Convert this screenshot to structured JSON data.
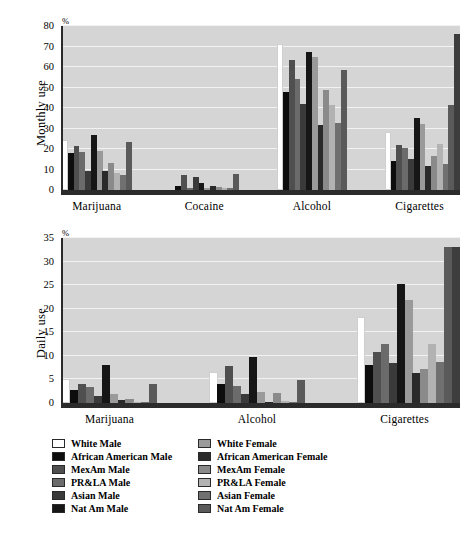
{
  "figure": {
    "background": "#ffffff",
    "plot_background": "#d5d5d5",
    "gridline_color": "#f2f2f2",
    "baseline_color": "#4a4a4a"
  },
  "series_names": [
    "White Male",
    "African American Male",
    "MexAm Male",
    "PR&LA Male",
    "Asian Male",
    "Nat Am Male",
    "White Female",
    "African American Female",
    "MexAm Female",
    "PR&LA Female",
    "Asian Female",
    "Nat Am Female"
  ],
  "series_colors": [
    "#ffffff",
    "#0d0d0d",
    "#4f4f4f",
    "#6b6b6b",
    "#3a3a3a",
    "#161616",
    "#9a9a9a",
    "#2a2a2a",
    "#8a8a8a",
    "#b2b2b2",
    "#707070",
    "#5a5a5a"
  ],
  "legend": {
    "columns": [
      [
        {
          "label": "White Male",
          "color": "#ffffff"
        },
        {
          "label": "African American Male",
          "color": "#0d0d0d"
        },
        {
          "label": "MexAm Male",
          "color": "#4f4f4f"
        },
        {
          "label": "PR&LA Male",
          "color": "#6b6b6b"
        },
        {
          "label": "Asian Male",
          "color": "#3a3a3a"
        },
        {
          "label": "Nat Am Male",
          "color": "#161616"
        }
      ],
      [
        {
          "label": "White Female",
          "color": "#9a9a9a"
        },
        {
          "label": "African American Female",
          "color": "#2a2a2a"
        },
        {
          "label": "MexAm Female",
          "color": "#8a8a8a"
        },
        {
          "label": "PR&LA Female",
          "color": "#b2b2b2"
        },
        {
          "label": "Asian Female",
          "color": "#707070"
        },
        {
          "label": "Nat Am Female",
          "color": "#5a5a5a"
        }
      ]
    ]
  },
  "chart_data": [
    {
      "type": "bar",
      "title": "",
      "ylabel": "Monthly use",
      "xlabel": "",
      "unit_label": "%",
      "ylim": [
        0,
        80
      ],
      "yticks": [
        0,
        10,
        20,
        30,
        40,
        50,
        60,
        70,
        80
      ],
      "grid": true,
      "legend_position": "below-figure",
      "categories": [
        "Marijuana",
        "Cocaine",
        "Alcohol",
        "Cigarettes"
      ],
      "series": [
        {
          "name": "White Male",
          "values": [
            24.5,
            0,
            71.0,
            28.5
          ]
        },
        {
          "name": "African American Male",
          "values": [
            18.0,
            2.0,
            48.0,
            14.0
          ]
        },
        {
          "name": "MexAm Male",
          "values": [
            21.5,
            7.5,
            63.5,
            22.0
          ]
        },
        {
          "name": "PR&LA Male",
          "values": [
            18.5,
            1.0,
            54.0,
            20.5
          ]
        },
        {
          "name": "Asian Male",
          "values": [
            9.5,
            6.5,
            42.0,
            15.0
          ]
        },
        {
          "name": "Nat Am Male",
          "values": [
            27.0,
            3.5,
            67.5,
            35.0
          ]
        },
        {
          "name": "White Female",
          "values": [
            19.0,
            0.8,
            65.0,
            32.0
          ]
        },
        {
          "name": "African American Female",
          "values": [
            9.5,
            2.0,
            31.5,
            11.5
          ]
        },
        {
          "name": "MexAm Female",
          "values": [
            13.0,
            1.5,
            49.0,
            16.5
          ]
        },
        {
          "name": "PR&LA Female",
          "values": [
            8.5,
            1.2,
            41.5,
            22.5
          ]
        },
        {
          "name": "Asian Female",
          "values": [
            7.5,
            1.0,
            32.5,
            12.5
          ]
        },
        {
          "name": "Nat Am Female",
          "values": [
            23.5,
            8.0,
            58.5,
            41.5
          ]
        }
      ],
      "overflow_bar": {
        "category": "Cigarettes",
        "series": "Nat Am Female",
        "value": 76.0
      }
    },
    {
      "type": "bar",
      "title": "",
      "ylabel": "Daily use",
      "xlabel": "",
      "unit_label": "%",
      "ylim": [
        0,
        35
      ],
      "yticks": [
        0,
        5,
        10,
        15,
        20,
        25,
        30,
        35
      ],
      "grid": true,
      "legend_position": "below-figure",
      "categories": [
        "Marijuana",
        "Alcohol",
        "Cigarettes"
      ],
      "series": [
        {
          "name": "White Male",
          "values": [
            5.0,
            6.5,
            18.2
          ]
        },
        {
          "name": "African American Male",
          "values": [
            2.8,
            4.0,
            8.0
          ]
        },
        {
          "name": "MexAm Male",
          "values": [
            4.1,
            7.9,
            10.9
          ]
        },
        {
          "name": "PR&LA Male",
          "values": [
            3.4,
            3.6,
            12.6
          ]
        },
        {
          "name": "Asian Male",
          "values": [
            1.5,
            2.0,
            8.5
          ]
        },
        {
          "name": "Nat Am Male",
          "values": [
            8.0,
            9.7,
            25.3
          ]
        },
        {
          "name": "White Female",
          "values": [
            2.0,
            2.4,
            21.9
          ]
        },
        {
          "name": "African American Female",
          "values": [
            0.6,
            0.3,
            6.4
          ]
        },
        {
          "name": "MexAm Female",
          "values": [
            0.8,
            2.1,
            7.3
          ]
        },
        {
          "name": "PR&LA Female",
          "values": [
            0.2,
            0.4,
            12.5
          ]
        },
        {
          "name": "Asian Female",
          "values": [
            0.2,
            0.2,
            8.6
          ]
        },
        {
          "name": "Nat Am Female",
          "values": [
            4.1,
            4.9,
            33.0
          ]
        }
      ],
      "overflow_bar": {
        "category": "Cigarettes",
        "series": "extra-right",
        "value": 33.2
      }
    }
  ]
}
